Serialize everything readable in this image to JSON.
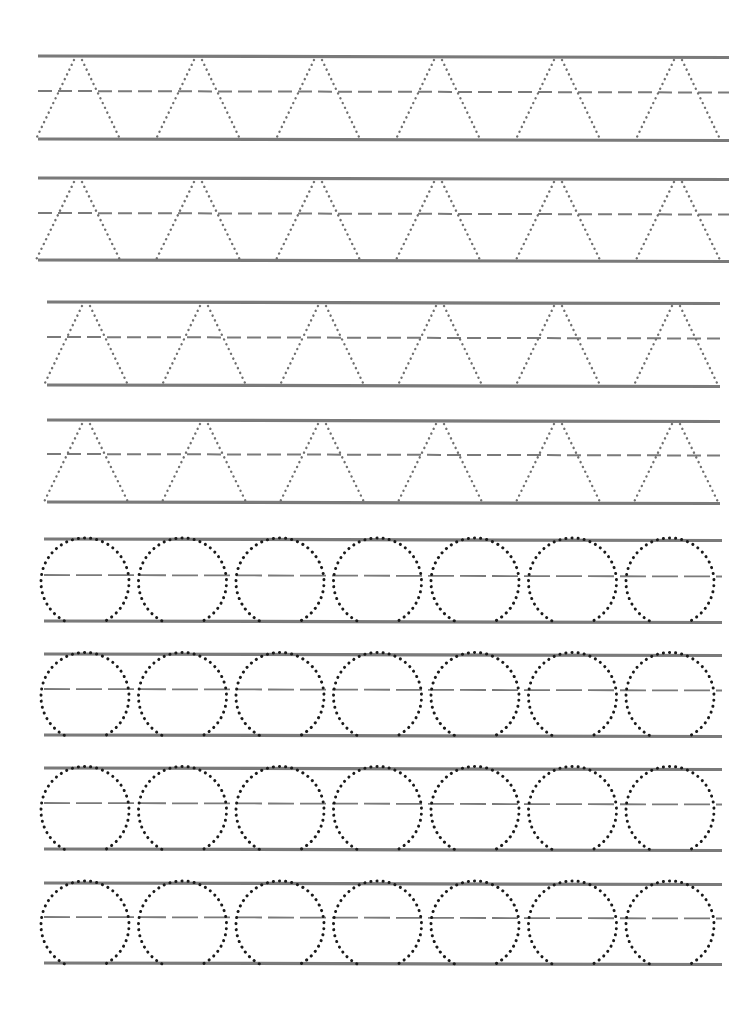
{
  "worksheet": {
    "title": "Letter A and circle tracing practice",
    "colors": {
      "background": "#ffffff",
      "guide_line": "#7a7a7a",
      "midline": "#7a7a7a",
      "letter_dots": "#6f6f6f",
      "circle_dots": "#1a1a1a"
    },
    "rows": [
      {
        "type": "letter",
        "glyph": "A",
        "x1": 38,
        "x2": 729,
        "top": 56,
        "mid": 91,
        "bottom": 139,
        "count": 6,
        "start": 78,
        "step": 120,
        "halfwidth": 42
      },
      {
        "type": "letter",
        "glyph": "A",
        "x1": 38,
        "x2": 729,
        "top": 178,
        "mid": 213,
        "bottom": 260,
        "count": 6,
        "start": 78,
        "step": 120,
        "halfwidth": 42
      },
      {
        "type": "letter",
        "glyph": "A",
        "x1": 47,
        "x2": 720,
        "top": 302,
        "mid": 337,
        "bottom": 385,
        "count": 6,
        "start": 86,
        "step": 118,
        "halfwidth": 42
      },
      {
        "type": "letter",
        "glyph": "A",
        "x1": 47,
        "x2": 720,
        "top": 420,
        "mid": 454,
        "bottom": 502,
        "count": 6,
        "start": 86,
        "step": 118,
        "halfwidth": 42
      },
      {
        "type": "circle",
        "x1": 44,
        "x2": 722,
        "top": 539,
        "mid": 575,
        "bottom": 621,
        "count": 7,
        "start": 85,
        "step": 97.5,
        "radius": 44
      },
      {
        "type": "circle",
        "x1": 44,
        "x2": 722,
        "top": 654,
        "mid": 689,
        "bottom": 735,
        "count": 7,
        "start": 85,
        "step": 97.5,
        "radius": 44
      },
      {
        "type": "circle",
        "x1": 44,
        "x2": 722,
        "top": 768,
        "mid": 803,
        "bottom": 849,
        "count": 7,
        "start": 85,
        "step": 97.5,
        "radius": 44
      },
      {
        "type": "circle",
        "x1": 44,
        "x2": 722,
        "top": 883,
        "mid": 917,
        "bottom": 963,
        "count": 7,
        "start": 85,
        "step": 97.5,
        "radius": 44
      }
    ]
  }
}
